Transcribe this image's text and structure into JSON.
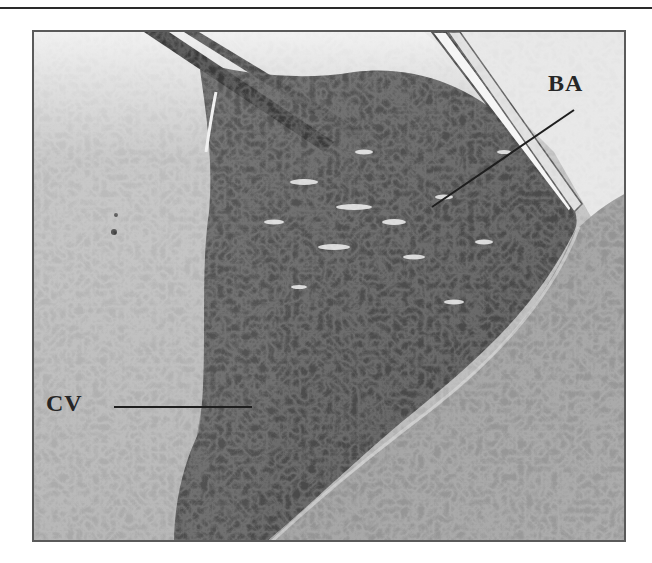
{
  "page": {
    "running_header": "…y   g   …   g",
    "rule_color": "#2a2a2a"
  },
  "figure": {
    "type": "grayscale intraoperative photograph",
    "frame_color": "#5a5a5a",
    "labels": [
      {
        "id": "ba",
        "text": "BA",
        "x": 548,
        "y": 80,
        "leader_from": [
          572,
          108
        ],
        "leader_to": [
          430,
          205
        ]
      },
      {
        "id": "cv",
        "text": "CV",
        "x": 46,
        "y": 392,
        "leader_from": [
          112,
          405
        ],
        "leader_to": [
          250,
          405
        ]
      }
    ]
  }
}
